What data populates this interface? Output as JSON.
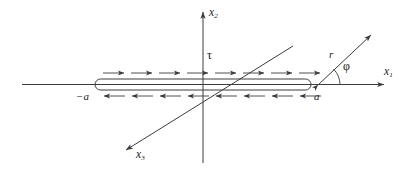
{
  "figure": {
    "background_color": "#ffffff",
    "line_color": "#3c3c3c",
    "text_color": "#1a1a1a"
  },
  "axes": [
    {
      "id": "x1",
      "label": "x",
      "sub": "1",
      "name": "horizontal-axis",
      "direction": "right"
    },
    {
      "id": "x2",
      "label": "x",
      "sub": "2",
      "name": "vertical-axis",
      "direction": "up"
    },
    {
      "id": "x3",
      "label": "x",
      "sub": "3",
      "name": "depth-axis",
      "direction": "down-left"
    }
  ],
  "labels": {
    "x1": "x",
    "x1_sub": "1",
    "x2": "x",
    "x2_sub": "2",
    "x3": "x",
    "x3_sub": "3",
    "tau": "τ",
    "phi": "φ",
    "r": "r",
    "a_positive": "a",
    "a_negative": "−a"
  },
  "strip": {
    "name": "current-strip",
    "left_end": "−a",
    "right_end": "a",
    "label": "τ",
    "top_arrow_count": 8,
    "top_arrow_direction": "right",
    "bottom_arrow_count": 8,
    "bottom_arrow_direction": "left"
  },
  "ray": {
    "name": "radial-ray",
    "length_label": "r",
    "angle_label": "φ",
    "origin_mark": "a"
  }
}
